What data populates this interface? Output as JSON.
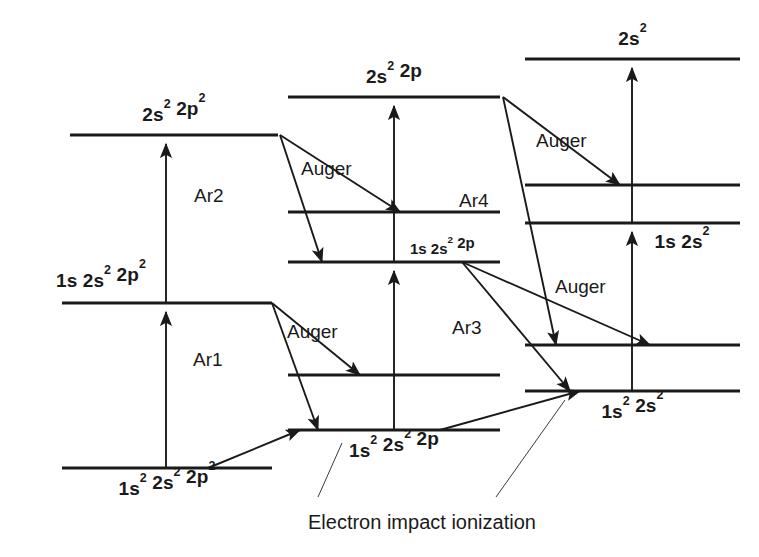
{
  "figure": {
    "kind": "atomic-energy-level-diagram",
    "caption": "Electron impact ionization",
    "ink_color": "#1a1a1a",
    "background_color": "#ffffff"
  },
  "columns": [
    {
      "id": "col-left",
      "name": "two-electron-removed-column",
      "levels": [
        {
          "id": "L1",
          "label": "2s² 2p²",
          "label_pos": "above",
          "y": 135,
          "x1": 70,
          "x2": 278
        },
        {
          "id": "L2",
          "label": "1s 2s² 2p²",
          "label_pos": "above-left",
          "y": 303,
          "x1": 62,
          "x2": 272
        },
        {
          "id": "L3",
          "label": "1s² 2s² 2p²",
          "label_pos": "below",
          "y": 468,
          "x1": 62,
          "x2": 272
        }
      ]
    },
    {
      "id": "col-middle",
      "name": "one-electron-removed-column",
      "levels": [
        {
          "id": "M1",
          "label": "2s² 2p",
          "label_pos": "above",
          "y": 97,
          "x1": 288,
          "x2": 500
        },
        {
          "id": "M2",
          "label": "",
          "label_pos": "none",
          "y": 212,
          "x1": 288,
          "x2": 500
        },
        {
          "id": "M3",
          "label": "1s 2s² 2p",
          "label_pos": "above-right",
          "y": 262,
          "x1": 288,
          "x2": 500
        },
        {
          "id": "M4",
          "label": "",
          "label_pos": "none",
          "y": 375,
          "x1": 288,
          "x2": 500
        },
        {
          "id": "M5",
          "label": "1s² 2s² 2p",
          "label_pos": "below",
          "y": 430,
          "x1": 288,
          "x2": 500
        }
      ]
    },
    {
      "id": "col-right",
      "name": "fully-stripped-2p-column",
      "levels": [
        {
          "id": "R1",
          "label": "2s²",
          "label_pos": "above",
          "y": 59,
          "x1": 525,
          "x2": 740
        },
        {
          "id": "R2",
          "label": "",
          "label_pos": "none",
          "y": 185,
          "x1": 525,
          "x2": 740
        },
        {
          "id": "R3",
          "label": "1s 2s²",
          "label_pos": "below-right",
          "y": 223,
          "x1": 525,
          "x2": 740
        },
        {
          "id": "R4",
          "label": "",
          "label_pos": "none",
          "y": 345,
          "x1": 525,
          "x2": 740
        },
        {
          "id": "R5",
          "label": "1s² 2s²",
          "label_pos": "below",
          "y": 391,
          "x1": 525,
          "x2": 740
        }
      ]
    }
  ],
  "excitation_arrows": [
    {
      "id": "E1",
      "name": "excitation-left-ground-to-L2",
      "from": "L3",
      "to": "L2",
      "x": 166
    },
    {
      "id": "E2",
      "name": "excitation-left-L2-to-L1",
      "from": "L2",
      "to": "L1",
      "x": 166
    },
    {
      "id": "E3",
      "name": "excitation-middle-M5-to-M3",
      "from": "M5",
      "to": "M3",
      "x": 394
    },
    {
      "id": "E4",
      "name": "excitation-middle-M3-to-M1",
      "from": "M3",
      "to": "M1",
      "x": 394
    },
    {
      "id": "E5",
      "name": "excitation-right-R5-to-R3",
      "from": "R5",
      "to": "R3",
      "x": 632
    },
    {
      "id": "E6",
      "name": "excitation-right-R3-to-R1",
      "from": "R3",
      "to": "R1",
      "x": 632
    }
  ],
  "transitions": [
    {
      "id": "T1",
      "label": "Auger",
      "name": "auger-L1-to-M2",
      "from": [
        280,
        135
      ],
      "to": [
        400,
        212
      ],
      "label_xy": [
        301,
        175
      ]
    },
    {
      "id": "T2",
      "label": "Ar2",
      "name": "ar2-L1-to-M3",
      "from": [
        280,
        135
      ],
      "to": [
        322,
        262
      ],
      "label_xy": [
        194,
        202
      ]
    },
    {
      "id": "T3",
      "label": "Auger",
      "name": "auger-L2-to-M4",
      "from": [
        272,
        303
      ],
      "to": [
        360,
        375
      ],
      "label_xy": [
        287,
        338
      ]
    },
    {
      "id": "T4",
      "label": "Ar1",
      "name": "ar1-L2-to-M5",
      "from": [
        272,
        303
      ],
      "to": [
        318,
        430
      ],
      "label_xy": [
        193,
        366
      ]
    },
    {
      "id": "T5",
      "label": "Auger",
      "name": "auger-M1-to-R2",
      "from": [
        503,
        97
      ],
      "to": [
        620,
        185
      ],
      "label_xy": [
        536,
        147
      ]
    },
    {
      "id": "T6",
      "label": "Ar4",
      "name": "ar4-M1-to-R4",
      "from": [
        503,
        97
      ],
      "to": [
        556,
        345
      ],
      "label_xy": [
        459,
        207
      ]
    },
    {
      "id": "T7",
      "label": "Auger",
      "name": "auger-M3-to-R4",
      "from": [
        462,
        262
      ],
      "to": [
        650,
        345
      ],
      "label_xy": [
        555,
        293
      ]
    },
    {
      "id": "T8",
      "label": "Ar3",
      "name": "ar3-M3-to-R5",
      "from": [
        462,
        262
      ],
      "to": [
        570,
        391
      ],
      "label_xy": [
        452,
        334
      ]
    }
  ],
  "ionization_arrows": [
    {
      "id": "I1",
      "name": "ionization-L3-to-M5",
      "from": [
        208,
        468
      ],
      "to": [
        300,
        430
      ]
    },
    {
      "id": "I2",
      "name": "ionization-M5-to-R5",
      "from": [
        440,
        430
      ],
      "to": [
        580,
        391
      ]
    }
  ],
  "caption": {
    "text": "Electron impact ionization",
    "xy": [
      308,
      529
    ],
    "leaders": [
      {
        "name": "caption-leader-left",
        "from": [
          318,
          497
        ],
        "to": [
          342,
          443
        ]
      },
      {
        "name": "caption-leader-right",
        "from": [
          496,
          497
        ],
        "to": [
          565,
          400
        ]
      }
    ]
  }
}
